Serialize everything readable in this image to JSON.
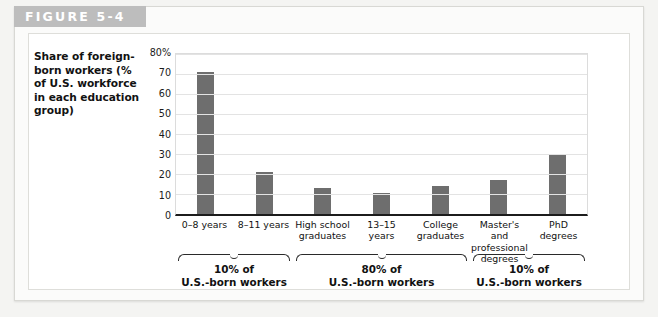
{
  "figure": {
    "header_label": "FIGURE 5-4"
  },
  "axis_title": "Share of foreign-born workers (% of U.S. workforce in each education group)",
  "groups": [
    {
      "pct": "10% of",
      "who": "U.S.-born workers"
    },
    {
      "pct": "80% of",
      "who": "U.S.-born workers"
    },
    {
      "pct": "10% of",
      "who": "U.S.-born workers"
    }
  ],
  "chart_data": {
    "type": "bar",
    "title": "FIGURE 5-4",
    "xlabel": "",
    "ylabel": "Share of foreign-born workers (% of U.S. workforce in each education group)",
    "ylim": [
      0,
      80
    ],
    "yticks": [
      "0",
      "10",
      "20",
      "30",
      "40",
      "50",
      "60",
      "70",
      "80%"
    ],
    "grid": true,
    "legend": "none",
    "bar_color": "#6e6e6e",
    "categories": [
      "0–8 years",
      "8–11 years",
      "High school graduates",
      "13–15 years",
      "College graduates",
      "Master's and professional degrees",
      "PhD degrees"
    ],
    "values": [
      71,
      21,
      13,
      10.5,
      14,
      17,
      30
    ]
  }
}
